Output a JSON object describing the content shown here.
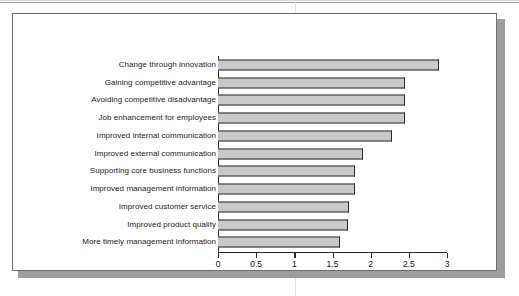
{
  "figure": {
    "frame_color": "#6d6d6d",
    "shadow_color": "#9d9d9d",
    "background": "#ffffff"
  },
  "chart_data": {
    "type": "bar",
    "orientation": "horizontal",
    "title": "",
    "subtitle": "",
    "xlabel": "",
    "ylabel": "",
    "categories": [
      "Change through innovation",
      "Gaining competitive advantage",
      "Avoiding competitive disadvantage",
      "Job enhancement for employees",
      "Improved internal communication",
      "Improved external communication",
      "Supporting core business functions",
      "Improved management information",
      "Improved customer service",
      "Improved product quality",
      "More timely management information"
    ],
    "values": [
      2.9,
      2.45,
      2.45,
      2.45,
      2.28,
      1.9,
      1.8,
      1.8,
      1.72,
      1.7,
      1.6
    ],
    "xlim": [
      0,
      3
    ],
    "xticks": [
      0,
      0.5,
      1,
      1.5,
      2,
      2.5,
      3
    ],
    "xtick_labels": [
      "0",
      "0.5",
      "1",
      "1.5",
      "2",
      "2.5",
      "3"
    ],
    "grid": false,
    "legend": null,
    "bar_fill_color": "#c9c9c9",
    "bar_edge_color": "#2b2b2b",
    "axis_color": "#2b2b2b"
  }
}
